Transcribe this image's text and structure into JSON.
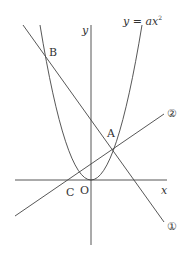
{
  "diagram": {
    "curve_label": "y = ax²",
    "curve_label_parts": {
      "lhs": "y",
      "eq": " = ",
      "rhs": "ax",
      "exp": "2"
    },
    "axis_y_label": "y",
    "axis_x_label": "x",
    "origin_label": "O",
    "points": {
      "A": "A",
      "B": "B",
      "C": "C"
    },
    "line_labels": {
      "line1": "①",
      "line2": "②"
    },
    "colors": {
      "stroke": "#444444",
      "text": "#333333",
      "background": "#ffffff"
    }
  }
}
